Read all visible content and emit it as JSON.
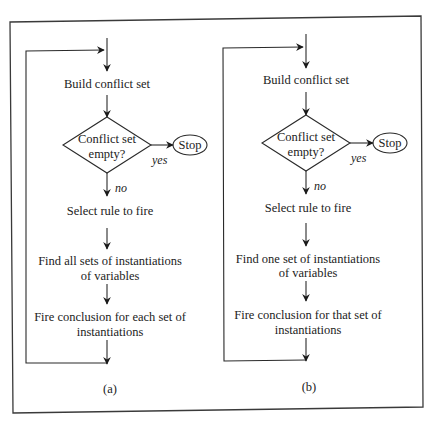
{
  "figure": {
    "panels": [
      {
        "caption": "(a)",
        "steps": {
          "build": "Build conflict set",
          "decision_line1": "Conflict set",
          "decision_line2": "empty?",
          "yes_label": "yes",
          "no_label": "no",
          "stop": "Stop",
          "select": "Select rule to fire",
          "find_line1": "Find all sets of instantiations",
          "find_line2": "of variables",
          "fire_line1": "Fire conclusion for each set of",
          "fire_line2": "instantiations"
        }
      },
      {
        "caption": "(b)",
        "steps": {
          "build": "Build conflict set",
          "decision_line1": "Conflict set",
          "decision_line2": "empty?",
          "yes_label": "yes",
          "no_label": "no",
          "stop": "Stop",
          "select": "Select rule to fire",
          "find_line1": "Find one set of instantiations",
          "find_line2": "of variables",
          "fire_line1": "Fire conclusion for that set of",
          "fire_line2": "instantiations"
        }
      }
    ],
    "colors": {
      "line": "#2a2a2a",
      "background": "#ffffff"
    }
  }
}
